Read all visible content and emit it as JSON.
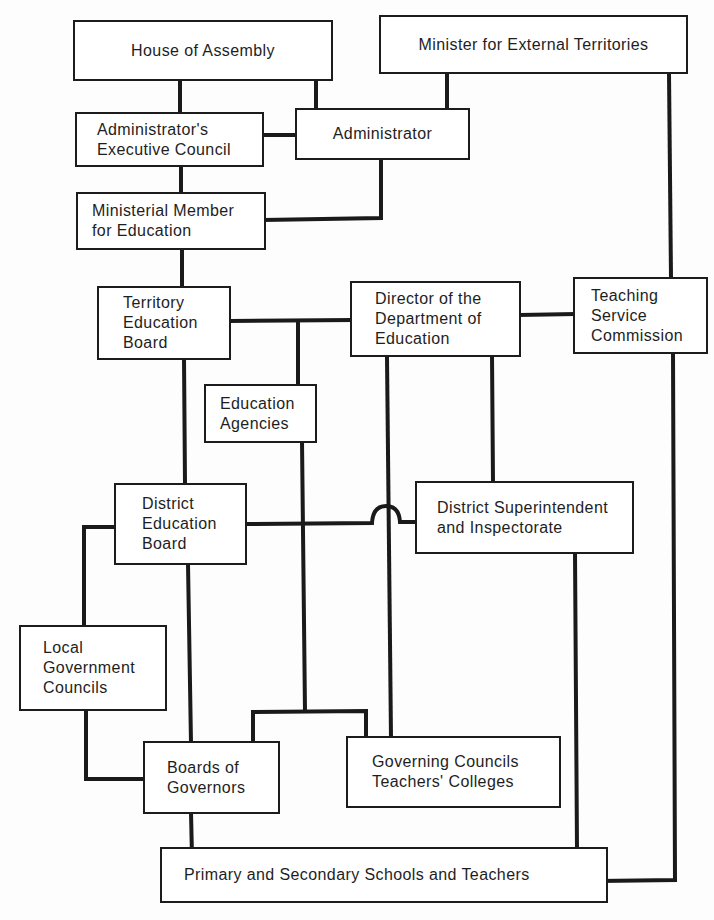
{
  "diagram": {
    "type": "organizational-chart",
    "nodes": [
      {
        "id": "house",
        "label": "House of Assembly"
      },
      {
        "id": "minister",
        "label": "Minister for External Territories"
      },
      {
        "id": "exec",
        "label": "Administrator's\nExecutive Council"
      },
      {
        "id": "admin",
        "label": "Administrator"
      },
      {
        "id": "ministerial",
        "label": "Ministerial Member\nfor Education"
      },
      {
        "id": "territory",
        "label": "Territory\nEducation\nBoard"
      },
      {
        "id": "director",
        "label": "Director of the\nDepartment of\nEducation"
      },
      {
        "id": "tsc",
        "label": "Teaching\nService\nCommission"
      },
      {
        "id": "agencies",
        "label": "Education\nAgencies"
      },
      {
        "id": "deb",
        "label": "District\nEducation\nBoard"
      },
      {
        "id": "dsi",
        "label": "District Superintendent\nand Inspectorate"
      },
      {
        "id": "lgc",
        "label": "Local\nGovernment\nCouncils"
      },
      {
        "id": "bog",
        "label": "Boards of\nGovernors"
      },
      {
        "id": "gctc",
        "label": "Governing Councils\nTeachers' Colleges"
      },
      {
        "id": "schools",
        "label": "Primary and Secondary Schools and Teachers"
      }
    ],
    "edges": [
      [
        "house",
        "exec"
      ],
      [
        "house",
        "admin"
      ],
      [
        "minister",
        "admin"
      ],
      [
        "exec",
        "admin"
      ],
      [
        "exec",
        "ministerial"
      ],
      [
        "admin",
        "ministerial"
      ],
      [
        "ministerial",
        "territory"
      ],
      [
        "territory",
        "director"
      ],
      [
        "territory",
        "agencies"
      ],
      [
        "director",
        "tsc"
      ],
      [
        "minister",
        "tsc"
      ],
      [
        "territory",
        "deb"
      ],
      [
        "director",
        "dsi"
      ],
      [
        "director",
        "gctc"
      ],
      [
        "deb",
        "dsi"
      ],
      [
        "deb",
        "lgc"
      ],
      [
        "deb",
        "bog"
      ],
      [
        "lgc",
        "bog"
      ],
      [
        "agencies",
        "bog"
      ],
      [
        "agencies",
        "gctc"
      ],
      [
        "bog",
        "schools"
      ],
      [
        "dsi",
        "schools"
      ],
      [
        "tsc",
        "schools"
      ]
    ]
  }
}
